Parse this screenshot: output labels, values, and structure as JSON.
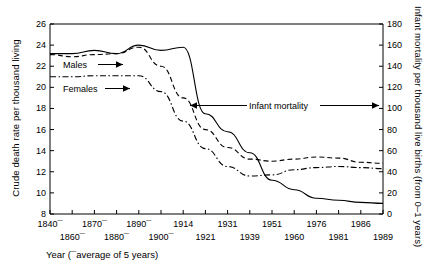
{
  "chart_data": {
    "type": "line",
    "title": "",
    "xlabel": "Year (¯average of 5 years)",
    "ylabel": "Crude death rate per thousand living",
    "y2label": "Infant mortality per thousand live births (from 0–1 years)",
    "ylim": [
      8,
      26
    ],
    "y2lim": [
      0,
      180
    ],
    "yticks": [
      8,
      10,
      12,
      14,
      16,
      18,
      20,
      22,
      24,
      26
    ],
    "y2ticks": [
      0,
      20,
      40,
      60,
      80,
      100,
      120,
      140,
      160,
      180
    ],
    "grid": false,
    "legend_position": "inline-annotations",
    "x_tick_labels_top": [
      "1840¯",
      "1870¯",
      "1890¯",
      "1914",
      "1931",
      "1951",
      "1976",
      "1986"
    ],
    "x_tick_labels_bottom": [
      "1860¯",
      "1880¯",
      "1900¯",
      "1921",
      "1939",
      "1960",
      "1981",
      "1989"
    ],
    "x": [
      "1840",
      "1860",
      "1870",
      "1880",
      "1890",
      "1900",
      "1914",
      "1921",
      "1931",
      "1939",
      "1951",
      "1960",
      "1976",
      "1981",
      "1986",
      "1989"
    ],
    "series": [
      {
        "name": "Infant mortality",
        "style": "solid",
        "axis": "right",
        "values": [
          152,
          152,
          155,
          152,
          160,
          155,
          158,
          95,
          78,
          58,
          32,
          23,
          15,
          13,
          11,
          10
        ]
      },
      {
        "name": "Males",
        "style": "dashed",
        "axis": "left",
        "values": [
          23.1,
          22.9,
          23.1,
          23.2,
          23.8,
          22.0,
          19.0,
          16.0,
          14.3,
          13.2,
          13.0,
          13.2,
          13.4,
          13.3,
          12.9,
          12.8
        ]
      },
      {
        "name": "Females",
        "style": "dash-dot",
        "axis": "left",
        "values": [
          21.0,
          21.0,
          21.1,
          21.1,
          21.1,
          19.6,
          16.8,
          14.2,
          12.5,
          11.6,
          11.7,
          12.2,
          12.4,
          12.5,
          12.4,
          12.3
        ]
      }
    ],
    "annotations": [
      {
        "text": "Males",
        "arrow": "right"
      },
      {
        "text": "Females",
        "arrow": "right"
      },
      {
        "text": "Infant mortality",
        "arrow": "both"
      }
    ]
  },
  "axes": {
    "y_left_title": "Crude death rate per thousand living",
    "y_right_title": "Infant mortality per thousand live births (from 0–1 years)",
    "x_title": "Year (¯average of 5 years)"
  },
  "colors": {
    "line": "#000000",
    "background": "#ffffff",
    "text": "#000000"
  }
}
